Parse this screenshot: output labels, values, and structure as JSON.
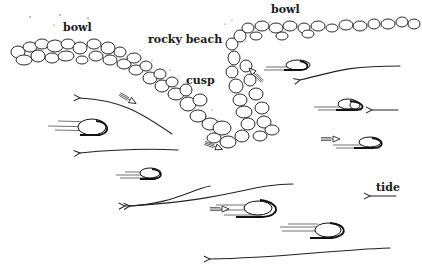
{
  "diagram": {
    "type": "sketch",
    "labels": {
      "bowl_left": "bowl",
      "bowl_right": "bowl",
      "rocky_beach": "rocky beach",
      "cusp": "cusp",
      "tide": "tide"
    },
    "colors": {
      "ink": "#111111",
      "background": "#ffffff"
    },
    "elements": {
      "rock_band_upper_left": "bowl shoreline of stacked rocks",
      "rock_band_upper_right": "bowl shoreline of stacked rocks",
      "cusp_promontory": "rock cusp projecting seaward between bowls",
      "flow_arrows": 7,
      "moving_pebbles": 7,
      "small_darts": 5,
      "tide_arrow_direction": "left"
    }
  }
}
